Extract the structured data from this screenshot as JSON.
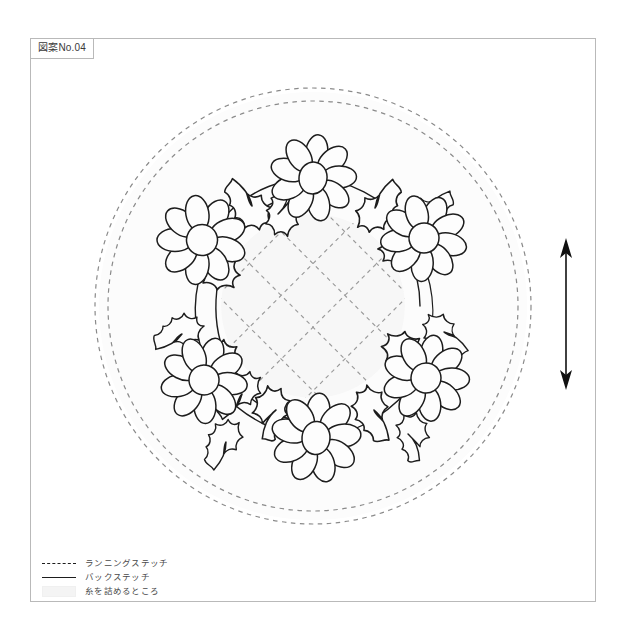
{
  "sheet": {
    "label": "図案No.04",
    "frame_color": "#b9b9b9",
    "background": "#ffffff"
  },
  "design": {
    "title": "花のリース刺しゅう図案",
    "motif": "daisy-wreath",
    "flower_count": 6,
    "ink_color": "#1d1d1d",
    "guide_color": "#8a8a8a",
    "fill_color": "#fbfbfb",
    "lattice_fill": "#f7f7f7",
    "running_circles": 2,
    "lattice_lines_per_direction": 4,
    "center": {
      "cx": 283,
      "cy": 268
    },
    "outer_circle_r": 218,
    "inner_circle_r": 206,
    "lattice_clip_r": 92,
    "flowers": [
      {
        "id": "flower-top",
        "cx": 283,
        "cy": 140,
        "r": 23,
        "petals": 9,
        "rot": 8
      },
      {
        "id": "flower-upper-right",
        "cx": 394,
        "cy": 200,
        "r": 23,
        "petals": 9,
        "rot": 24
      },
      {
        "id": "flower-lower-right",
        "cx": 396,
        "cy": 340,
        "r": 23,
        "petals": 9,
        "rot": 12
      },
      {
        "id": "flower-bottom",
        "cx": 286,
        "cy": 400,
        "r": 24,
        "petals": 9,
        "rot": 5
      },
      {
        "id": "flower-lower-left",
        "cx": 174,
        "cy": 342,
        "r": 23,
        "petals": 9,
        "rot": 18
      },
      {
        "id": "flower-upper-left",
        "cx": 172,
        "cy": 202,
        "r": 24,
        "petals": 9,
        "rot": 30
      }
    ]
  },
  "grain_arrow": {
    "name": "grain-direction-arrow",
    "orientation": "vertical",
    "double_headed": true,
    "color": "#111111"
  },
  "legend": {
    "items": [
      {
        "key": "dashed",
        "label": "ランニングステッチ"
      },
      {
        "key": "solid",
        "label": "バックステッチ"
      },
      {
        "key": "swatch",
        "label": "糸を詰めるところ"
      }
    ]
  }
}
